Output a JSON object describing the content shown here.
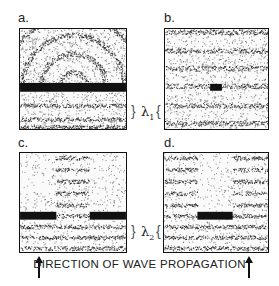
{
  "figure": {
    "panels": [
      {
        "id": "a",
        "label": "a.",
        "description": "semicircular diffracted wavefronts above breakwater"
      },
      {
        "id": "b",
        "label": "b.",
        "description": "plane waves passing small obstacle"
      },
      {
        "id": "c",
        "label": "c.",
        "description": "waves through narrow gap between two barriers"
      },
      {
        "id": "d",
        "label": "d.",
        "description": "shadow zone behind wide barrier"
      }
    ],
    "wavelength_labels": {
      "lambda1": "λ",
      "lambda1_sub": "1",
      "lambda2": "λ",
      "lambda2_sub": "2"
    },
    "caption": "DIRECTION OF WAVE PROPAGATION",
    "colors": {
      "ink": "#111111",
      "paper": "#ffffff"
    }
  }
}
